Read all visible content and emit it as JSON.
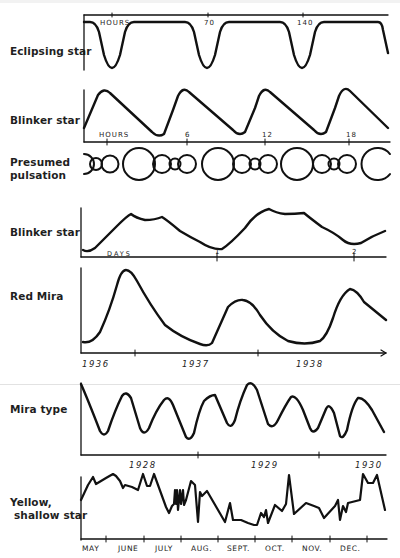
{
  "panels": [
    {
      "label": "Eclipsing star",
      "axis_unit": "HOURS",
      "ticks": [
        "70",
        "140"
      ]
    },
    {
      "label": "Blinker star",
      "axis_unit": "HOURS",
      "ticks": [
        "6",
        "12",
        "18"
      ]
    },
    {
      "label_line1": "Presumed",
      "label_line2": "pulsation"
    },
    {
      "label": "Blinker star",
      "axis_unit": "DAYS",
      "ticks": [
        "1",
        "2"
      ]
    },
    {
      "label": "Red Mira",
      "ticks": [
        "1936",
        "1937",
        "1938"
      ]
    },
    {
      "label": "Mira type",
      "ticks": [
        "1928",
        "1929",
        "1930"
      ]
    },
    {
      "label_line1": "Yellow,",
      "label_line2": "shallow star",
      "ticks": [
        "MAY",
        "JUNE",
        "JULY",
        "AUG.",
        "SEPT.",
        "OCT.",
        "NOV.",
        "DEC."
      ]
    }
  ],
  "colors": {
    "ink": "#111111",
    "paper": "#ffffff",
    "fold": "#e2e2e2"
  }
}
